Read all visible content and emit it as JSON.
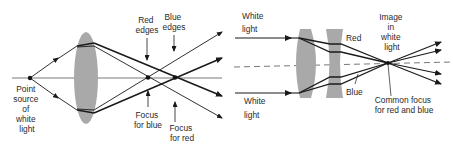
{
  "caption_fragment": "",
  "left_panel": {
    "title": "Chromatic aberration of a single lens",
    "labels": {
      "source": [
        "Point",
        "source",
        "of",
        "white",
        "light"
      ],
      "red_edges": [
        "Red",
        "edges"
      ],
      "blue_edges": [
        "Blue",
        "edges"
      ],
      "focus_blue": [
        "Focus",
        "for blue"
      ],
      "focus_red": [
        "Focus",
        "for red"
      ]
    }
  },
  "right_panel": {
    "title": "Achromatic doublet",
    "labels": {
      "white_light_top": [
        "White",
        "light"
      ],
      "white_light_bottom": [
        "White",
        "light"
      ],
      "red": "Red",
      "blue": "Blue",
      "image": [
        "Image",
        "in",
        "white",
        "light"
      ],
      "common_focus": [
        "Common focus",
        "for red and blue"
      ]
    }
  },
  "colors": {
    "lens": "#a9a9a9",
    "ray": "#1a1a1a",
    "axis": "#555555"
  }
}
